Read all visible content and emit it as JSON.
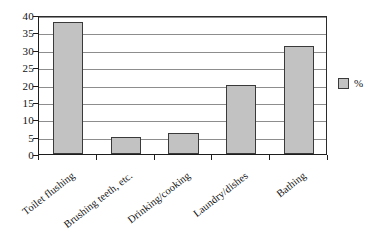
{
  "chart_data": {
    "type": "bar",
    "title": "",
    "subtitle": "",
    "xlabel": "",
    "ylabel": "",
    "categories": [
      "Toilet flushing",
      "Brushing teeth, etc.",
      "Drinking/cooking",
      "Laundry/dishes",
      "Bathing"
    ],
    "series": [
      {
        "name": "%",
        "values": [
          38,
          5,
          6,
          20,
          31
        ]
      }
    ],
    "values": [
      38,
      5,
      6,
      20,
      31
    ],
    "ylim": [
      0,
      40
    ],
    "ytick_values": [
      0,
      5,
      10,
      15,
      20,
      25,
      30,
      35,
      40
    ],
    "ytick_labels": [
      "0",
      "5",
      "10",
      "15",
      "20",
      "25",
      "30",
      "35",
      "40"
    ],
    "grid": "horizontal",
    "legend_position": "right",
    "legend_entries": [
      "%"
    ],
    "colors": {
      "bar_fill": "#c2c2c2",
      "bar_border": "#3a3a3a",
      "gridline": "#8d8d8d",
      "axis": "#1d1d1d",
      "background": "#ffffff",
      "text": "#111111"
    }
  }
}
